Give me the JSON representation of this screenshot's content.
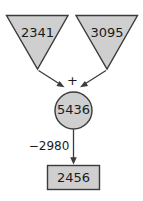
{
  "diagram": {
    "type": "arithmetic-flow-diagram",
    "colors": {
      "node_fill": "#cfcfcf",
      "node_stroke": "#3b3b3b",
      "edge_stroke": "#3b3b3b",
      "text": "#1a1a1a",
      "background": "#ffffff"
    },
    "nodes": [
      {
        "id": "operand-left",
        "shape": "inverted-triangle",
        "value": "2341"
      },
      {
        "id": "operand-right",
        "shape": "inverted-triangle",
        "value": "3095"
      },
      {
        "id": "sum",
        "shape": "circle",
        "value": "5436"
      },
      {
        "id": "result",
        "shape": "rectangle",
        "value": "2456"
      }
    ],
    "operators": [
      {
        "id": "addition-operator",
        "symbol": "+"
      }
    ],
    "edges": [
      {
        "id": "edge-left-to-sum",
        "from": "operand-left",
        "to": "sum",
        "label": ""
      },
      {
        "id": "edge-right-to-sum",
        "from": "operand-right",
        "to": "sum",
        "label": ""
      },
      {
        "id": "edge-sum-to-result",
        "from": "sum",
        "to": "result",
        "label": "−2980"
      }
    ]
  }
}
